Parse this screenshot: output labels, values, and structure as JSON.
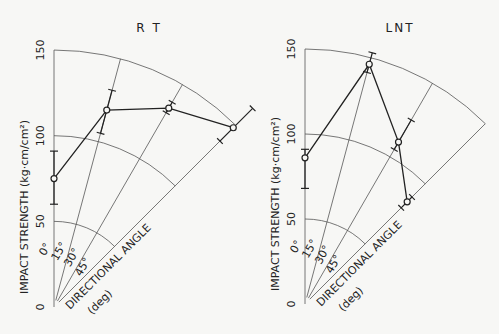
{
  "chart_data": [
    {
      "type": "polar-line",
      "title": "R T",
      "radial_label": "IMPACT STRENGTH (kg·cm/cm²)",
      "angular_label": "DIRECTIONAL ANGLE",
      "angular_unit": "(deg)",
      "radial_ticks": [
        0,
        50,
        100,
        150
      ],
      "radial_range": [
        0,
        150
      ],
      "angle_ticks": [
        "0°",
        "15°",
        "30°",
        "45°"
      ],
      "angles": [
        0,
        15,
        30,
        45
      ],
      "values": [
        75,
        119,
        134,
        148
      ],
      "error_low": [
        60,
        105,
        131,
        137
      ],
      "error_high": [
        91,
        131,
        138,
        164
      ]
    },
    {
      "type": "polar-line",
      "title": "LNT",
      "radial_label": "IMPACT STRENGTH (kg·cm/cm²)",
      "angular_label": "DIRECTIONAL ANGLE",
      "angular_unit": "(deg)",
      "radial_ticks": [
        0,
        50,
        100,
        150
      ],
      "radial_range": [
        0,
        150
      ],
      "angle_ticks": [
        "0°",
        "15°",
        "30°",
        "45°"
      ],
      "angles": [
        0,
        15,
        30,
        45
      ],
      "values": [
        86,
        146,
        110,
        85
      ],
      "error_low": [
        68,
        141,
        105,
        80
      ],
      "error_high": [
        91,
        153,
        125,
        89
      ]
    }
  ],
  "layout": {
    "panels": [
      {
        "origin": [
          54,
          307
        ],
        "px_per_unit": 1.713
      },
      {
        "origin": [
          305,
          304
        ],
        "px_per_unit": 1.7
      }
    ]
  }
}
